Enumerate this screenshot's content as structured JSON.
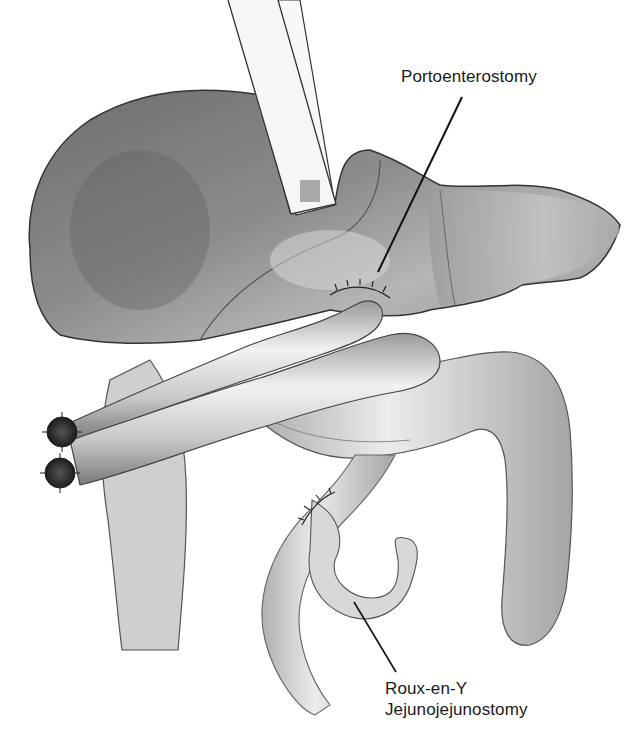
{
  "figure": {
    "background_color": "#ffffff",
    "ink_color": "#1a1a1a",
    "labels": {
      "portoenterostomy": "Portoenterostomy",
      "roux_line1": "Roux-en-Y",
      "roux_line2": "Jejunojejunostomy"
    },
    "structures": [
      {
        "name": "liver",
        "shading": "#8a8a8a"
      },
      {
        "name": "retractor",
        "shading": "#f4f4f4"
      },
      {
        "name": "roux-limb",
        "shading": "#bdbdbd"
      },
      {
        "name": "stomach-duodenum",
        "shading": "#c8c8c8"
      },
      {
        "name": "jejunum-loop",
        "shading": "#d0d0d0"
      },
      {
        "name": "stapled-ends",
        "count": 2
      },
      {
        "name": "suture-line-portoenterostomy"
      },
      {
        "name": "suture-line-jejunojejunostomy"
      }
    ]
  }
}
